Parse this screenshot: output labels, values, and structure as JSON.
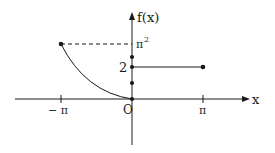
{
  "figure": {
    "type": "piecewise-function-graph",
    "axes": {
      "x_label": "x",
      "y_label": "f(x)",
      "origin_label": "O",
      "x_ticks": [
        "− π",
        "π"
      ],
      "y_ticks": [
        "2",
        "π²"
      ]
    },
    "labels": {
      "y_axis": "f(x)",
      "x_axis": "x",
      "origin": "O",
      "neg_pi": "− π",
      "pi": "π",
      "two": "2",
      "pi_sq_base": "π",
      "pi_sq_exp": "2"
    },
    "pieces": [
      {
        "name": "curve",
        "domain": "[-π, 0]",
        "from": [
          -3.14159,
          9.8696
        ],
        "to": [
          0,
          0
        ],
        "shape": "concave-up curve (x²)"
      },
      {
        "name": "constant",
        "domain": "(0, π]",
        "value": 2,
        "from": [
          0,
          2
        ],
        "to": [
          3.14159,
          2
        ]
      }
    ],
    "points_on_y_axis": [
      "upper-dot",
      "2",
      "lower-dot",
      "0"
    ],
    "dashed_guide": "from (-π, π²) to y-axis at π²",
    "colors": {
      "ink": "#1a1a1a",
      "background": "#ffffff"
    }
  }
}
